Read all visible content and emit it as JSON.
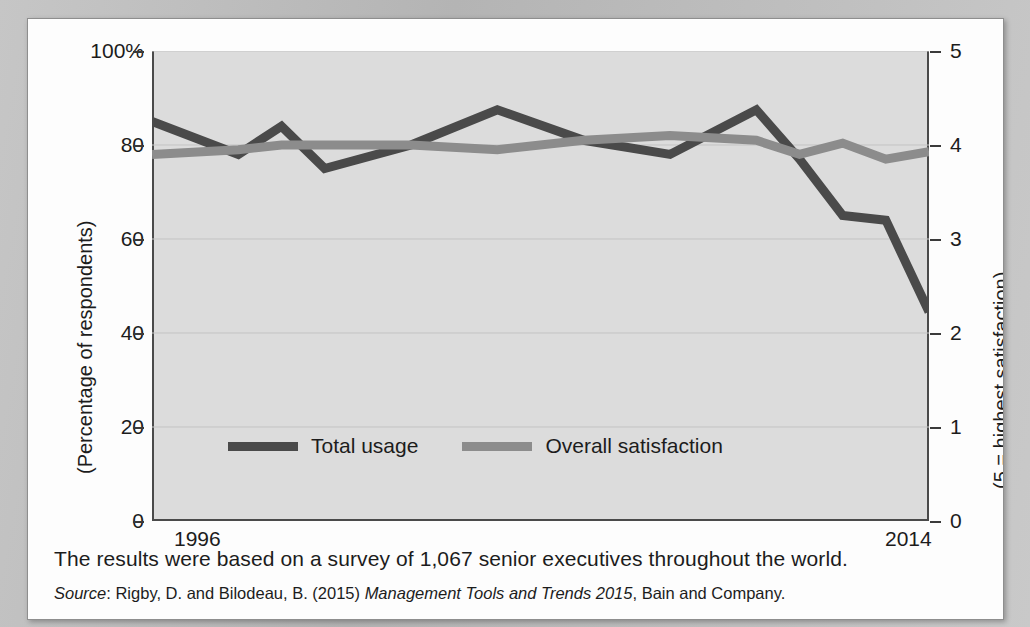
{
  "figure": {
    "note": "The results were based on a survey of 1,067 senior executives throughout the world.",
    "source_prefix": "Source",
    "source_sep": ": ",
    "source_authors": "Rigby, D. and Bilodeau, B. (2015) ",
    "source_title": "Management Tools and Trends 2015",
    "source_publisher": ", Bain and Company."
  },
  "colors": {
    "usage_line": "#4a4a4a",
    "satisfaction_line": "#8c8c8c",
    "plot_background": "#dcdcdc",
    "axis": "#3a3a3a",
    "gridline": "#c3c3c3",
    "page": "#fdfdfd",
    "text": "#1c1c1c"
  },
  "chart_data": {
    "type": "line",
    "title": "",
    "subtitle": "",
    "xlabel": "",
    "ylabel": "(Percentage of respondents)",
    "y2label": "(5 = highest satisfaction)",
    "x_tick_labels": [
      "1996",
      "2014"
    ],
    "x_range": [
      1996,
      2014
    ],
    "ylim": [
      0,
      100
    ],
    "y_ticks": [
      0,
      20,
      40,
      60,
      80,
      100
    ],
    "y_tick_labels": [
      "0",
      "20",
      "40",
      "60",
      "80",
      "100%"
    ],
    "y2lim": [
      0,
      5
    ],
    "y2_ticks": [
      0,
      1,
      2,
      3,
      4,
      5
    ],
    "y2_tick_labels": [
      "0",
      "1",
      "2",
      "3",
      "4",
      "5"
    ],
    "grid": true,
    "legend_position": "inside-bottom-left",
    "x": [
      1996,
      1998,
      1999,
      2000,
      2002,
      2004,
      2006,
      2008,
      2010,
      2011,
      2012,
      2013,
      2014
    ],
    "series": [
      {
        "name": "Total usage",
        "axis": "left",
        "color": "#4a4a4a",
        "units": "percent",
        "values": [
          85,
          78,
          84,
          75,
          80,
          87.5,
          81,
          78,
          87.5,
          77,
          65,
          64,
          44.5
        ]
      },
      {
        "name": "Overall satisfaction",
        "axis": "right",
        "color": "#8c8c8c",
        "units": "rating_0_5",
        "values": [
          3.9,
          3.95,
          4.0,
          4.0,
          4.0,
          3.95,
          4.05,
          4.1,
          4.05,
          3.9,
          4.02,
          3.85,
          3.93
        ],
        "values_as_percent": [
          78,
          79,
          80,
          80,
          80,
          79,
          81,
          82,
          81,
          78,
          80.4,
          77,
          78.6
        ]
      }
    ]
  },
  "legend": {
    "items": [
      {
        "label": "Total usage",
        "color": "#4a4a4a"
      },
      {
        "label": "Overall satisfaction",
        "color": "#8c8c8c"
      }
    ]
  }
}
